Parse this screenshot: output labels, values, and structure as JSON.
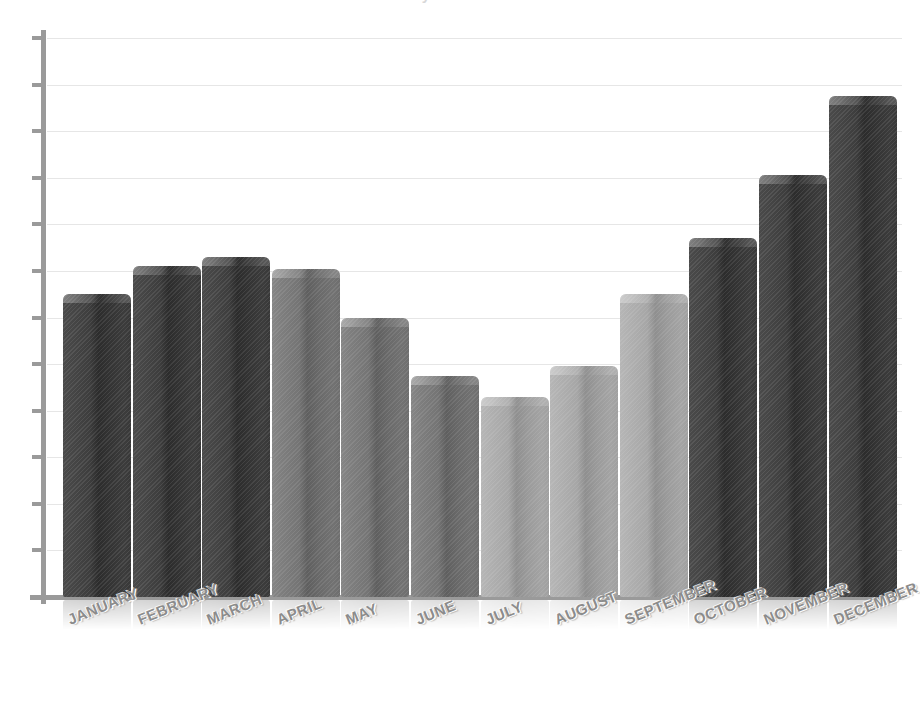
{
  "chart": {
    "title_sliver": "Monthly Performance",
    "axis": {
      "baseline_y": 597,
      "tick_count": 13,
      "y_labels_shown": false,
      "grid": true,
      "grid_color": "#e6e6e6",
      "axis_color": "#9a9a9a"
    },
    "style": {
      "background": "#ffffff",
      "color_dark": "#3a3a3a",
      "color_mid": "#6e6e6e",
      "color_light": "#a0a0a0",
      "bar_shape": "3d-cylinder",
      "reflection": true,
      "label_rotation_deg": -22
    }
  },
  "chart_data": {
    "type": "bar",
    "title": "Monthly Performance",
    "xlabel": "",
    "ylabel": "",
    "ylim": [
      0,
      12
    ],
    "grid": true,
    "legend": "none",
    "categories": [
      "JANUARY",
      "FEBRUARY",
      "MARCH",
      "APRIL",
      "MAY",
      "JUNE",
      "JULY",
      "AUGUST",
      "SEPTEMBER",
      "OCTOBER",
      "NOVEMBER",
      "DECEMBER"
    ],
    "values": [
      6.5,
      7.1,
      7.3,
      7.05,
      6.0,
      4.75,
      4.3,
      4.95,
      6.5,
      7.7,
      9.05,
      10.75
    ],
    "bar_colors": [
      "dark",
      "dark",
      "dark",
      "mid",
      "mid",
      "mid",
      "light",
      "light",
      "light",
      "dark",
      "dark",
      "dark"
    ],
    "axis_ticks": [
      0,
      1,
      2,
      3,
      4,
      5,
      6,
      7,
      8,
      9,
      10,
      11,
      12
    ],
    "tick_labels_visible": false
  }
}
